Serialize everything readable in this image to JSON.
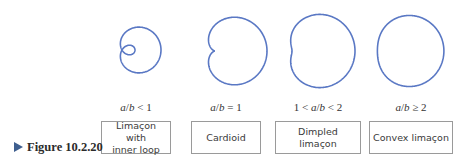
{
  "figure": {
    "label": "Figure 10.2.20",
    "marker_color": "#3f5f8f"
  },
  "curve_color": "#5a78c4",
  "panels": [
    {
      "condition": "a/b < 1",
      "name": "Limaçon with inner loop",
      "name_lines": [
        "Limaçon with",
        "inner loop"
      ],
      "ratio_a_over_b": 0.5,
      "cx": 135,
      "cy": 50,
      "scale": 26,
      "cond_x": 101,
      "cond_w": 70,
      "box_x": 101,
      "box_w": 70
    },
    {
      "condition": "a/b = 1",
      "name": "Cardioid",
      "name_lines": [
        "Cardioid"
      ],
      "ratio_a_over_b": 1,
      "cx": 228,
      "cy": 51,
      "scale": 26,
      "cond_x": 191,
      "cond_w": 70,
      "box_x": 191,
      "box_w": 70
    },
    {
      "condition": "1 < a/b < 2",
      "name": "Dimpled limaçon",
      "name_lines": [
        "Dimpled limaçon"
      ],
      "ratio_a_over_b": 1.5,
      "cx": 313,
      "cy": 51,
      "scale": 21,
      "cond_x": 275,
      "cond_w": 86,
      "box_x": 275,
      "box_w": 86
    },
    {
      "condition": "a/b ≥ 2",
      "name": "Convex limaçon",
      "name_lines": [
        "Convex limaçon"
      ],
      "ratio_a_over_b": 2.5,
      "cx": 404,
      "cy": 51,
      "scale": 13.3,
      "cond_x": 369,
      "cond_w": 84,
      "box_x": 369,
      "box_w": 84
    }
  ]
}
